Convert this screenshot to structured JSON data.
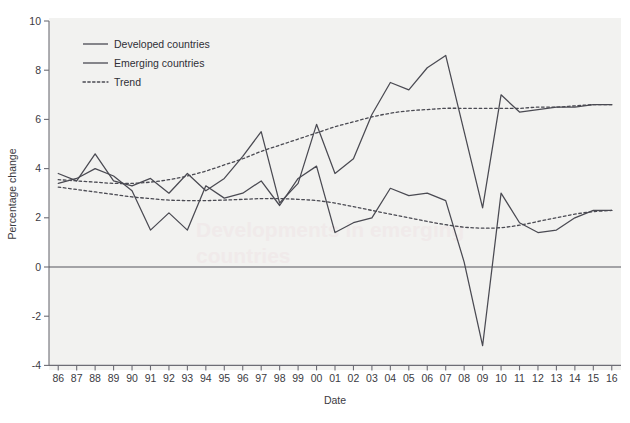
{
  "chart_data": {
    "type": "line",
    "title": "",
    "xlabel": "Date",
    "ylabel": "Percentage change",
    "xlim": [
      1985.5,
      2016.5
    ],
    "ylim": [
      -4,
      10
    ],
    "yticks": [
      -4,
      -2,
      0,
      2,
      4,
      6,
      8,
      10
    ],
    "ytick_labels": [
      "-4",
      "-2",
      "0",
      "2",
      "4",
      "6",
      "8",
      "10"
    ],
    "grid": false,
    "legend_position": "top-left",
    "x": [
      1986,
      1987,
      1988,
      1989,
      1990,
      1991,
      1992,
      1993,
      1994,
      1995,
      1996,
      1997,
      1998,
      1999,
      2000,
      2001,
      2002,
      2003,
      2004,
      2005,
      2006,
      2007,
      2008,
      2009,
      2010,
      2011,
      2012,
      2013,
      2014,
      2015,
      2016
    ],
    "xtick_labels": [
      "86",
      "87",
      "88",
      "89",
      "90",
      "91",
      "92",
      "93",
      "94",
      "95",
      "96",
      "97",
      "98",
      "99",
      "00",
      "01",
      "02",
      "03",
      "04",
      "05",
      "06",
      "07",
      "08",
      "09",
      "10",
      "11",
      "12",
      "13",
      "14",
      "15",
      "16"
    ],
    "series": [
      {
        "name": "Developed countries",
        "style": "solid",
        "values": [
          3.4,
          3.6,
          4.0,
          3.7,
          3.1,
          1.5,
          2.2,
          1.5,
          3.3,
          2.8,
          3.0,
          3.5,
          2.5,
          3.6,
          4.1,
          1.4,
          1.8,
          2.0,
          3.2,
          2.9,
          3.0,
          2.7,
          0.2,
          -3.2,
          3.0,
          1.8,
          1.4,
          1.5,
          2.0,
          2.3,
          2.3
        ]
      },
      {
        "name": "Emerging countries",
        "style": "solid",
        "values": [
          3.8,
          3.5,
          4.6,
          3.5,
          3.3,
          3.6,
          3.0,
          3.8,
          3.1,
          3.6,
          4.5,
          5.5,
          2.6,
          3.4,
          5.8,
          3.8,
          4.4,
          6.2,
          7.5,
          7.2,
          8.1,
          8.6,
          5.5,
          2.4,
          7.0,
          6.3,
          6.4,
          6.5,
          6.5,
          6.6,
          6.6
        ]
      },
      {
        "name": "Trend",
        "style": "dotted",
        "description": "Trend for emerging countries (upper dotted curve)",
        "values": [
          3.55,
          3.5,
          3.45,
          3.4,
          3.4,
          3.45,
          3.55,
          3.7,
          3.9,
          4.15,
          4.4,
          4.7,
          4.95,
          5.2,
          5.45,
          5.7,
          5.9,
          6.1,
          6.25,
          6.35,
          6.4,
          6.45,
          6.45,
          6.45,
          6.45,
          6.45,
          6.5,
          6.5,
          6.55,
          6.6,
          6.6
        ]
      },
      {
        "name": "Trend",
        "style": "dotted",
        "description": "Trend for developed countries (lower dotted curve)",
        "values": [
          3.25,
          3.15,
          3.05,
          2.95,
          2.85,
          2.78,
          2.72,
          2.7,
          2.7,
          2.72,
          2.75,
          2.78,
          2.78,
          2.75,
          2.7,
          2.6,
          2.45,
          2.3,
          2.15,
          2.0,
          1.85,
          1.72,
          1.62,
          1.58,
          1.6,
          1.7,
          1.85,
          2.0,
          2.15,
          2.25,
          2.3
        ]
      }
    ]
  },
  "legend": {
    "items": [
      {
        "label": "Developed countries",
        "style": "solid"
      },
      {
        "label": "Emerging countries",
        "style": "solid"
      },
      {
        "label": "Trend",
        "style": "dotted"
      }
    ]
  },
  "colors": {
    "line": "#4a4a52",
    "axis": "#6d6d75",
    "plot_background": "#f2f2f0",
    "page_background": "#ffffff",
    "text": "#3b3b42"
  },
  "bleed_through": {
    "line1": "Developments in emerging",
    "line2": "countries"
  }
}
